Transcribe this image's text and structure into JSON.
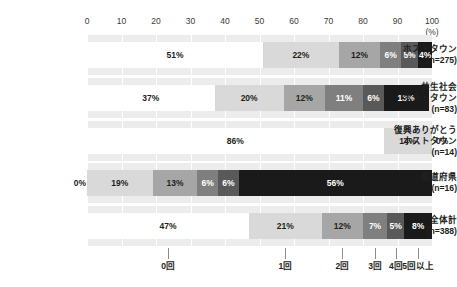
{
  "chart_data": {
    "type": "bar",
    "orientation": "horizontal",
    "stacked": true,
    "stack_percent": true,
    "title": "",
    "xlabel": "(%)",
    "ylabel": "",
    "xlim": [
      0,
      100
    ],
    "grid": true,
    "legend_position": "bottom",
    "axis_unit": "(%)",
    "x_ticks": [
      0,
      10,
      20,
      30,
      40,
      50,
      60,
      70,
      80,
      90,
      100
    ],
    "x_tick_labels": [
      "0",
      "10",
      "20",
      "30",
      "40",
      "50",
      "60",
      "70",
      "80",
      "90",
      "100"
    ],
    "categories": [
      "ホストタウン\n(n=275)",
      "共生社会\nホストタウン\n(n=83)",
      "復興ありがとう\nホストタウン\n(n=14)",
      "都道府県\n(n=16)",
      "全体計\n(n=388)"
    ],
    "series": [
      {
        "name": "0回",
        "color": "#ffffff",
        "text_color": "#231f20",
        "values": [
          51,
          37,
          86,
          0,
          47
        ]
      },
      {
        "name": "1回",
        "color": "#d9d9d9",
        "text_color": "#231f20",
        "values": [
          22,
          20,
          14,
          19,
          21
        ]
      },
      {
        "name": "2回",
        "color": "#a6a6a6",
        "text_color": "#231f20",
        "values": [
          12,
          12,
          0,
          13,
          12
        ]
      },
      {
        "name": "3回",
        "color": "#7f7f7f",
        "text_color": "#ffffff",
        "values": [
          6,
          11,
          0,
          6,
          7
        ]
      },
      {
        "name": "4回",
        "color": "#595959",
        "text_color": "#ffffff",
        "values": [
          5,
          6,
          0,
          6,
          5
        ]
      },
      {
        "name": "5回以上",
        "color": "#1a1a1a",
        "text_color": "#ffffff",
        "values": [
          4,
          13,
          0,
          56,
          8
        ]
      }
    ],
    "legend_entries": [
      "0回",
      "1回",
      "2回",
      "3回",
      "4回",
      "5回以上"
    ],
    "notes": [
      "第3行(復興ありがとうホストタウン)の最終ラベル 0% はバー外側に表示",
      "第4行(都道府県)の先頭ラベル 0% はバー左外側に表示"
    ]
  },
  "rows": [
    {
      "label_lines": [
        "ホストタウン",
        "(n=275)"
      ],
      "segments": [
        {
          "label": "51%",
          "value": 51
        },
        {
          "label": "22%",
          "value": 22
        },
        {
          "label": "12%",
          "value": 12
        },
        {
          "label": "6%",
          "value": 6
        },
        {
          "label": "5%",
          "value": 5
        },
        {
          "label": "4%",
          "value": 4
        }
      ]
    },
    {
      "label_lines": [
        "共生社会",
        "ホストタウン",
        "(n=83)"
      ],
      "segments": [
        {
          "label": "37%",
          "value": 37
        },
        {
          "label": "20%",
          "value": 20
        },
        {
          "label": "12%",
          "value": 12
        },
        {
          "label": "11%",
          "value": 11
        },
        {
          "label": "6%",
          "value": 6
        },
        {
          "label": "13%",
          "value": 13
        }
      ]
    },
    {
      "label_lines": [
        "復興ありがとう",
        "ホストタウン",
        "(n=14)"
      ],
      "segments": [
        {
          "label": "86%",
          "value": 86
        },
        {
          "label": "14%",
          "value": 14
        },
        {
          "label": "0%",
          "value": 0
        }
      ]
    },
    {
      "label_lines": [
        "都道府県",
        "(n=16)"
      ],
      "segments": [
        {
          "label": "0%",
          "value": 0
        },
        {
          "label": "19%",
          "value": 19
        },
        {
          "label": "13%",
          "value": 13
        },
        {
          "label": "6%",
          "value": 6
        },
        {
          "label": "6%",
          "value": 6
        },
        {
          "label": "56%",
          "value": 56
        }
      ]
    },
    {
      "label_lines": [
        "全体計",
        "(n=388)"
      ],
      "segments": [
        {
          "label": "47%",
          "value": 47
        },
        {
          "label": "21%",
          "value": 21
        },
        {
          "label": "12%",
          "value": 12
        },
        {
          "label": "7%",
          "value": 7
        },
        {
          "label": "5%",
          "value": 5
        },
        {
          "label": "8%",
          "value": 8
        }
      ]
    }
  ],
  "legend": {
    "items": [
      {
        "label": "0回",
        "anchor_pct": 23.5
      },
      {
        "label": "1回",
        "anchor_pct": 57.5
      },
      {
        "label": "2回",
        "anchor_pct": 74.0
      },
      {
        "label": "3回",
        "anchor_pct": 83.5
      },
      {
        "label": "4回",
        "anchor_pct": 89.5
      },
      {
        "label": "5回以上",
        "anchor_pct": 96.0
      }
    ]
  }
}
